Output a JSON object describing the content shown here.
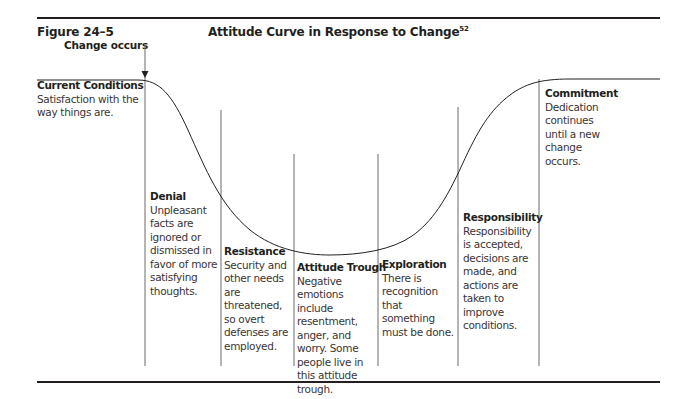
{
  "figure": {
    "label": "Figure 24–5",
    "title": "Attitude Curve in Response to Change",
    "footnote": "52"
  },
  "annotation": {
    "change_occurs": "Change occurs"
  },
  "stages": [
    {
      "title": "Current Conditions",
      "desc": "Satisfaction with the way things are."
    },
    {
      "title": "Denial",
      "desc": "Unpleasant facts are ignored or dismissed in favor of more satisfying thoughts."
    },
    {
      "title": "Resistance",
      "desc": "Security and other needs are threatened, so overt defenses are employed."
    },
    {
      "title": "Attitude Trough",
      "desc": "Negative emotions include resentment, anger, and worry. Some people live in this attitude trough."
    },
    {
      "title": "Exploration",
      "desc": "There is recognition that something must be done."
    },
    {
      "title": "Responsibility",
      "desc": "Responsibility is accepted, decisions are made, and actions are taken to improve conditions."
    },
    {
      "title": "Commitment",
      "desc": "Dedication continues until a new change occurs."
    }
  ],
  "colors": {
    "ink": "#231f20",
    "text": "#3a3536",
    "line": "#6d6a6b"
  }
}
